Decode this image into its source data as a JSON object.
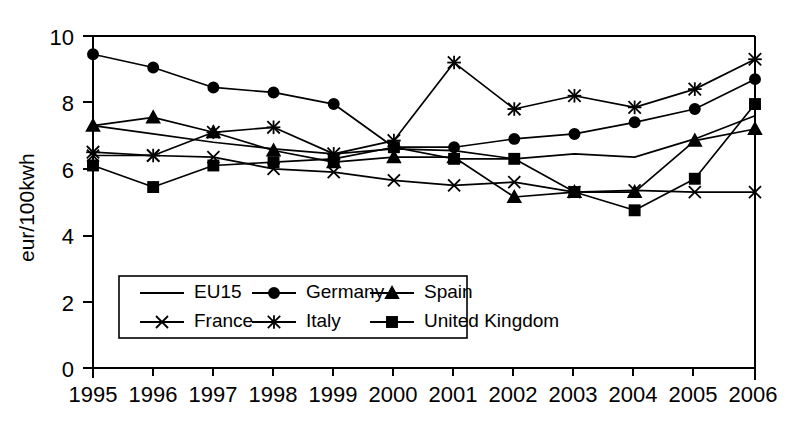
{
  "chart_data": {
    "type": "line",
    "title": "",
    "xlabel": "",
    "ylabel": "eur/100kwh",
    "categories": [
      "1995",
      "1996",
      "1997",
      "1998",
      "1999",
      "2000",
      "2001",
      "2002",
      "2003",
      "2004",
      "2005",
      "2006"
    ],
    "x": [
      1995,
      1996,
      1997,
      1998,
      1999,
      2000,
      2001,
      2002,
      2003,
      2004,
      2005,
      2006
    ],
    "xlim": [
      1995,
      2006
    ],
    "ylim": [
      0,
      10
    ],
    "yticks": [
      0,
      2,
      4,
      6,
      8,
      10
    ],
    "ytick_labels": [
      "0",
      "2",
      "4",
      "6",
      "8",
      "10"
    ],
    "grid": false,
    "legend_position": "lower-left-inside",
    "series": [
      {
        "name": "EU15",
        "marker": "none",
        "values": [
          7.3,
          7.05,
          6.8,
          6.6,
          6.45,
          6.6,
          6.55,
          6.3,
          6.45,
          6.35,
          6.9,
          7.6
        ]
      },
      {
        "name": "Germany",
        "marker": "circle",
        "values": [
          9.45,
          9.05,
          8.45,
          8.3,
          7.95,
          6.65,
          6.65,
          6.9,
          7.05,
          7.4,
          7.8,
          8.7
        ]
      },
      {
        "name": "Spain",
        "marker": "triangle",
        "values": [
          7.3,
          7.55,
          7.1,
          6.55,
          6.2,
          6.35,
          6.35,
          5.15,
          5.3,
          5.3,
          6.85,
          7.2
        ]
      },
      {
        "name": "France",
        "marker": "x",
        "values": [
          6.4,
          6.4,
          6.35,
          6.0,
          5.9,
          5.65,
          5.5,
          5.6,
          5.3,
          5.35,
          5.3,
          5.3
        ]
      },
      {
        "name": "Italy",
        "marker": "star",
        "values": [
          6.5,
          6.4,
          7.1,
          7.25,
          6.45,
          6.85,
          9.2,
          7.8,
          8.2,
          7.85,
          8.4,
          9.3
        ]
      },
      {
        "name": "United Kingdom",
        "marker": "square",
        "values": [
          6.1,
          5.45,
          6.1,
          6.2,
          6.3,
          6.65,
          6.3,
          6.3,
          5.3,
          4.75,
          5.7,
          7.95
        ]
      }
    ]
  },
  "legend": {
    "entries": [
      {
        "label": "EU15"
      },
      {
        "label": "Germany"
      },
      {
        "label": "Spain"
      },
      {
        "label": "France"
      },
      {
        "label": "Italy"
      },
      {
        "label": "United Kingdom"
      }
    ]
  }
}
